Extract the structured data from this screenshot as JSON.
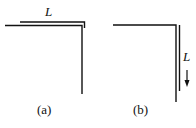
{
  "panels": [
    {
      "id": "a",
      "caption": "(a)",
      "length_label": "L"
    },
    {
      "id": "b",
      "caption": "(b)",
      "length_label": "L"
    }
  ],
  "colors": {
    "line": "#111111",
    "background": "#ffffff"
  }
}
